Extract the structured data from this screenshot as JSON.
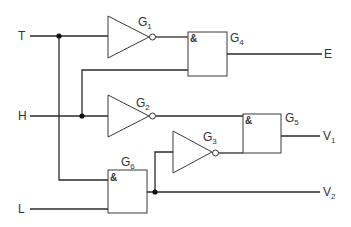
{
  "inputs": {
    "T": {
      "label": "T"
    },
    "H": {
      "label": "H"
    },
    "L": {
      "label": "L"
    }
  },
  "outputs": {
    "E": {
      "label": "E"
    },
    "V1": {
      "label": "V",
      "sub": "1"
    },
    "V2": {
      "label": "V",
      "sub": "2"
    }
  },
  "gates": {
    "G1": {
      "label": "G",
      "sub": "1",
      "type": "NOT"
    },
    "G2": {
      "label": "G",
      "sub": "2",
      "type": "NOT"
    },
    "G3": {
      "label": "G",
      "sub": "3",
      "type": "NOT"
    },
    "G4": {
      "label": "G",
      "sub": "4",
      "type": "AND",
      "symbol": "&"
    },
    "G5": {
      "label": "G",
      "sub": "5",
      "type": "AND",
      "symbol": "&"
    },
    "G6": {
      "label": "G",
      "sub": "6",
      "type": "AND",
      "symbol": "&"
    }
  },
  "colors": {
    "line": "#2a2a2a",
    "background": "#ffffff"
  }
}
